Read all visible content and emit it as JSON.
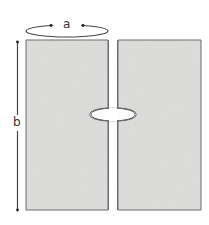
{
  "diagram": {
    "labels": {
      "width": "a",
      "height": "b"
    },
    "colors": {
      "panel_fill": "#dcdcda",
      "panel_stroke": "#6a6a6a",
      "line": "#444444",
      "background": "#ffffff"
    },
    "panels": [
      {
        "name": "left-panel"
      },
      {
        "name": "right-panel"
      }
    ]
  }
}
